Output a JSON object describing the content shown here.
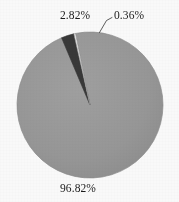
{
  "figure": {
    "background_color": "#ffffff",
    "text_color": "#1b1b1b"
  },
  "chart_data": {
    "type": "pie",
    "title": "",
    "subtitle": "",
    "xlabel": "",
    "ylabel": "",
    "legend": null,
    "grid": false,
    "start_angle_deg": 0,
    "direction": "clockwise",
    "center_px": [
      90,
      105
    ],
    "radius_px": 73,
    "categories": [
      "96.82%",
      "2.82%",
      "0.36%"
    ],
    "values": [
      96.82,
      2.82,
      0.36
    ],
    "value_unit": "percent",
    "slices": [
      {
        "label": "96.82%",
        "value": 96.82,
        "color": "#9a9a9a",
        "edge_color": "#8f8f8f",
        "label_position": "outside-bottom",
        "has_leader_line": false
      },
      {
        "label": "2.82%",
        "value": 2.82,
        "color": "#3a3a3a",
        "edge_color": "#2e2e2e",
        "label_position": "outside-top-left",
        "has_leader_line": false
      },
      {
        "label": "0.36%",
        "value": 0.36,
        "color": "#fdfdfd",
        "edge_color": "#9a9a9a",
        "label_position": "outside-top-right",
        "has_leader_line": true
      }
    ],
    "labels": {
      "dark_slice": "2.82%",
      "sliver_slice": "0.36%",
      "main_slice": "96.82%"
    }
  }
}
